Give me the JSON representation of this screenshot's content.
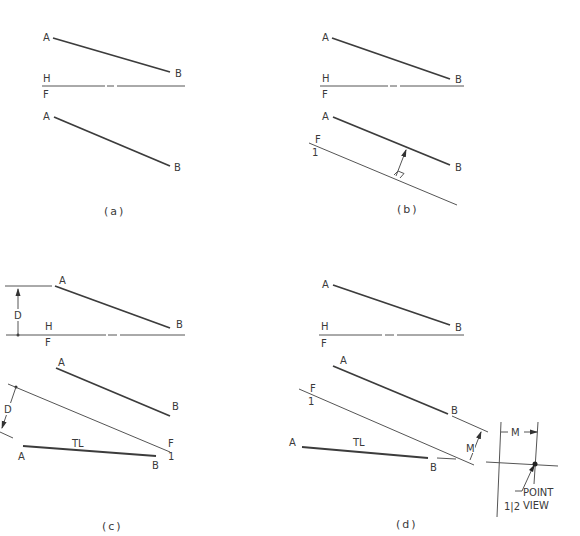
{
  "figure": {
    "panels": [
      {
        "caption": "(a)",
        "labels": {
          "top_A": "A",
          "top_B": "B",
          "fold_top": "H",
          "fold_bottom": "F",
          "front_A": "A",
          "front_B": "B"
        }
      },
      {
        "caption": "(b)",
        "labels": {
          "top_A": "A",
          "top_B": "B",
          "fold_top": "H",
          "fold_bottom": "F",
          "front_A": "A",
          "front_B": "B",
          "aux_fold_top": "F",
          "aux_fold_bottom": "1"
        }
      },
      {
        "caption": "(c)",
        "labels": {
          "top_A": "A",
          "top_B": "B",
          "fold_top": "H",
          "fold_bottom": "F",
          "dim_top": "D",
          "front_A": "A",
          "front_B": "B",
          "aux_fold_top": "F",
          "aux_fold_bottom": "1",
          "dim_aux": "D",
          "aux_A": "A",
          "aux_B": "B",
          "true_length": "TL"
        }
      },
      {
        "caption": "(d)",
        "labels": {
          "top_A": "A",
          "top_B": "B",
          "fold_top": "H",
          "fold_bottom": "F",
          "front_A": "A",
          "front_B": "B",
          "aux_fold_top": "F",
          "aux_fold_bottom": "1",
          "aux_A": "A",
          "aux_B": "B",
          "true_length": "TL",
          "dim_m1": "M",
          "dim_m2": "M",
          "fold_12": "1|2",
          "point_view_1": "POINT",
          "point_view_2": "VIEW"
        }
      }
    ]
  }
}
